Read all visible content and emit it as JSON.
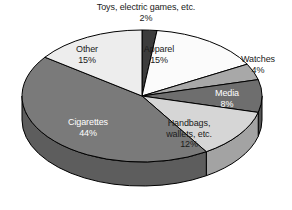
{
  "chart_data": {
    "type": "pie",
    "title": "",
    "subtitle": "",
    "xlabel": "",
    "ylabel": "",
    "legend_position": "none",
    "grid": false,
    "style": "3d-pie",
    "units": "percent",
    "categories": [
      "Toys, electric games, etc.",
      "Apparel",
      "Watches",
      "Media",
      "Handbags, wallets, etc.",
      "Cigarettes",
      "Other"
    ],
    "values": [
      2,
      15,
      4,
      8,
      12,
      44,
      15
    ],
    "slices": [
      {
        "label": "Toys, electric games, etc.",
        "label_line1": "Toys, electric games, etc.",
        "label_line2": "",
        "value": 2,
        "percent_text": "2%",
        "color": "#3c3c3c",
        "side_color": "#2b2b2b",
        "text_color": "#1a1a1a",
        "start_deg": 0,
        "end_deg": 7.2
      },
      {
        "label": "Apparel",
        "label_line1": "Apparel",
        "label_line2": "",
        "value": 15,
        "percent_text": "15%",
        "color": "#fbfbfb",
        "side_color": "#c9c9c9",
        "text_color": "#1a1a1a",
        "start_deg": 7.2,
        "end_deg": 61.2
      },
      {
        "label": "Watches",
        "label_line1": "Watches",
        "label_line2": "",
        "value": 4,
        "percent_text": "4%",
        "color": "#a8a8a8",
        "side_color": "#7d7d7d",
        "text_color": "#1a1a1a",
        "start_deg": 61.2,
        "end_deg": 75.6
      },
      {
        "label": "Media",
        "label_line1": "Media",
        "label_line2": "",
        "value": 8,
        "percent_text": "8%",
        "color": "#6e6e6e",
        "side_color": "#555555",
        "text_color": "#ffffff",
        "start_deg": 75.6,
        "end_deg": 104.4
      },
      {
        "label": "Handbags, wallets, etc.",
        "label_line1": "Handbags,",
        "label_line2": "wallets, etc.",
        "value": 12,
        "percent_text": "12%",
        "color": "#d6d6d6",
        "side_color": "#a3a3a3",
        "text_color": "#1a1a1a",
        "start_deg": 104.4,
        "end_deg": 147.6
      },
      {
        "label": "Cigarettes",
        "label_line1": "Cigarettes",
        "label_line2": "",
        "value": 44,
        "percent_text": "44%",
        "color": "#7a7a7a",
        "side_color": "#5d5d5d",
        "text_color": "#ffffff",
        "start_deg": 147.6,
        "end_deg": 306.0
      },
      {
        "label": "Other",
        "label_line1": "Other",
        "label_line2": "",
        "value": 15,
        "percent_text": "15%",
        "color": "#ededed",
        "side_color": "#b8b8b8",
        "text_color": "#1a1a1a",
        "start_deg": 306.0,
        "end_deg": 360.0
      }
    ],
    "colors": {
      "outline": "#000000",
      "background": "#ffffff",
      "label_dark": "#1a1a1a",
      "label_light": "#ffffff"
    }
  }
}
